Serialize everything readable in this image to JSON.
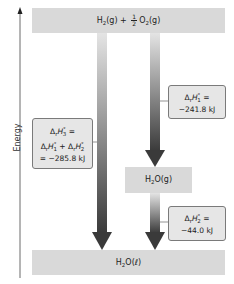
{
  "axis": {
    "label": "Energy"
  },
  "levels": {
    "top": {
      "species_1": "H",
      "sub_1": "2",
      "state_1": "(g) + ",
      "frac_num": "1",
      "frac_den": "2",
      "species_2": "O",
      "sub_2": "2",
      "state_2": "(g)"
    },
    "middle": {
      "species": "H",
      "sub": "2",
      "rest": "O(g)"
    },
    "bottom": {
      "species": "H",
      "sub": "2",
      "rest": "O(ℓ)"
    }
  },
  "annotations": {
    "dh1": {
      "delta": "Δ",
      "r": "r",
      "H": "H",
      "sup": "°",
      "sub": "1",
      "eq": " =",
      "value": "−241.8 kJ"
    },
    "dh2": {
      "delta": "Δ",
      "r": "r",
      "H": "H",
      "sup": "°",
      "sub": "2",
      "eq": " =",
      "value": "−44.0 kJ"
    },
    "dh3": {
      "line1_delta": "Δ",
      "line1_r": "r",
      "line1_H": "H",
      "line1_sup": "°",
      "line1_sub": "3",
      "line1_eq": " =",
      "line2_a_delta": "Δ",
      "line2_a_r": "r",
      "line2_a_H": "H",
      "line2_a_sup": "°",
      "line2_a_sub": "1",
      "plus": " + ",
      "line2_b_delta": "Δ",
      "line2_b_r": "r",
      "line2_b_H": "H",
      "line2_b_sup": "°",
      "line2_b_sub": "2",
      "value": "= −285.8 kJ"
    }
  },
  "colors": {
    "level_fill": "#d9d9d9",
    "note_fill": "#e6e6e6",
    "arrow_dark": "#3a3a3a",
    "arrow_light": "#e2e2e2"
  }
}
